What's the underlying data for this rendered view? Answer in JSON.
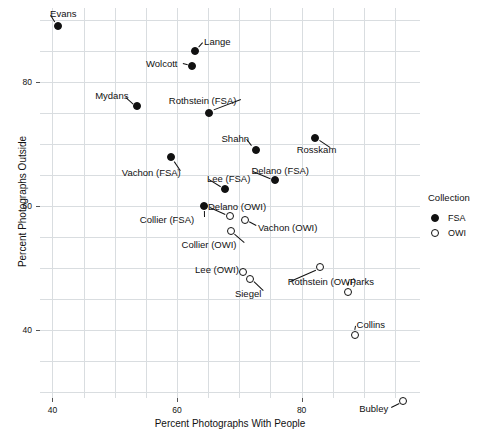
{
  "chart_data": {
    "type": "scatter",
    "title": "",
    "xlabel": "Percent Photographs With People",
    "ylabel": "Percent Photographs Outside",
    "xlim": [
      38,
      99
    ],
    "ylim": [
      29,
      92
    ],
    "xticks": [
      40,
      60,
      80
    ],
    "yticks": [
      40,
      60,
      80
    ],
    "grid": true,
    "legend": {
      "title": "Collection",
      "position": "right",
      "entries": [
        {
          "label": "FSA",
          "marker": "filled-circle"
        },
        {
          "label": "OWI",
          "marker": "hollow-circle"
        }
      ]
    },
    "series": [
      {
        "name": "FSA",
        "marker": "filled-circle",
        "points": [
          {
            "label": "Evans",
            "x": 40.9,
            "y": 89.1,
            "label_dx": -8,
            "label_dy": -13,
            "label_anchor": "start"
          },
          {
            "label": "Lange",
            "x": 62.9,
            "y": 85.0,
            "label_dx": 9,
            "label_dy": -10,
            "label_anchor": "start"
          },
          {
            "label": "Wolcott",
            "x": 62.4,
            "y": 82.7,
            "label_dx": -46,
            "label_dy": -3,
            "label_anchor": "start"
          },
          {
            "label": "Mydans",
            "x": 53.6,
            "y": 76.1,
            "label_dx": -42,
            "label_dy": -11,
            "label_anchor": "start"
          },
          {
            "label": "Rothstein (FSA)",
            "x": 65.1,
            "y": 75.1,
            "label_dx": -40,
            "label_dy": -13,
            "label_anchor": "start"
          },
          {
            "label": "Shahn",
            "x": 72.6,
            "y": 69.1,
            "label_dx": -34,
            "label_dy": -12,
            "label_anchor": "start"
          },
          {
            "label": "Rosskam",
            "x": 82.1,
            "y": 71.0,
            "label_dx": -18,
            "label_dy": 11,
            "label_anchor": "start"
          },
          {
            "label": "Vachon (FSA)",
            "x": 59.0,
            "y": 67.9,
            "label_dx": -49,
            "label_dy": 15,
            "label_anchor": "start"
          },
          {
            "label": "Delano (FSA)",
            "x": 75.8,
            "y": 64.2,
            "label_dx": -24,
            "label_dy": -10,
            "label_anchor": "start"
          },
          {
            "label": "Lee (FSA)",
            "x": 67.7,
            "y": 62.7,
            "label_dx": -18,
            "label_dy": -11,
            "label_anchor": "start"
          },
          {
            "label": "Collier (FSA)",
            "x": 64.3,
            "y": 60.0,
            "label_dx": -64,
            "label_dy": 13,
            "label_anchor": "start"
          }
        ]
      },
      {
        "name": "OWI",
        "marker": "hollow-circle",
        "points": [
          {
            "label": "Delano (OWI)",
            "x": 68.5,
            "y": 58.4,
            "label_dx": -22,
            "label_dy": -10,
            "label_anchor": "start"
          },
          {
            "label": "Vachon (OWI)",
            "x": 70.9,
            "y": 57.7,
            "label_dx": 13,
            "label_dy": 7,
            "label_anchor": "start"
          },
          {
            "label": "Collier (OWI)",
            "x": 68.6,
            "y": 56.0,
            "label_dx": -49,
            "label_dy": 13,
            "label_anchor": "start"
          },
          {
            "label": "Lee (OWI)",
            "x": 70.6,
            "y": 49.4,
            "label_dx": -48,
            "label_dy": -3,
            "label_anchor": "start"
          },
          {
            "label": "Siegel",
            "x": 71.7,
            "y": 48.3,
            "label_dx": -15,
            "label_dy": 14,
            "label_anchor": "start"
          },
          {
            "label": "Rothstein (OWI)",
            "x": 82.9,
            "y": 50.1,
            "label_dx": -32,
            "label_dy": 14,
            "label_anchor": "start"
          },
          {
            "label": "Parks",
            "x": 87.4,
            "y": 46.2,
            "label_dx": 2,
            "label_dy": -11,
            "label_anchor": "start"
          },
          {
            "label": "Collins",
            "x": 88.5,
            "y": 39.1,
            "label_dx": 2,
            "label_dy": -11,
            "label_anchor": "start"
          },
          {
            "label": "Bubley",
            "x": 96.3,
            "y": 28.5,
            "label_dx": -44,
            "label_dy": 7,
            "label_anchor": "start"
          }
        ]
      }
    ]
  }
}
